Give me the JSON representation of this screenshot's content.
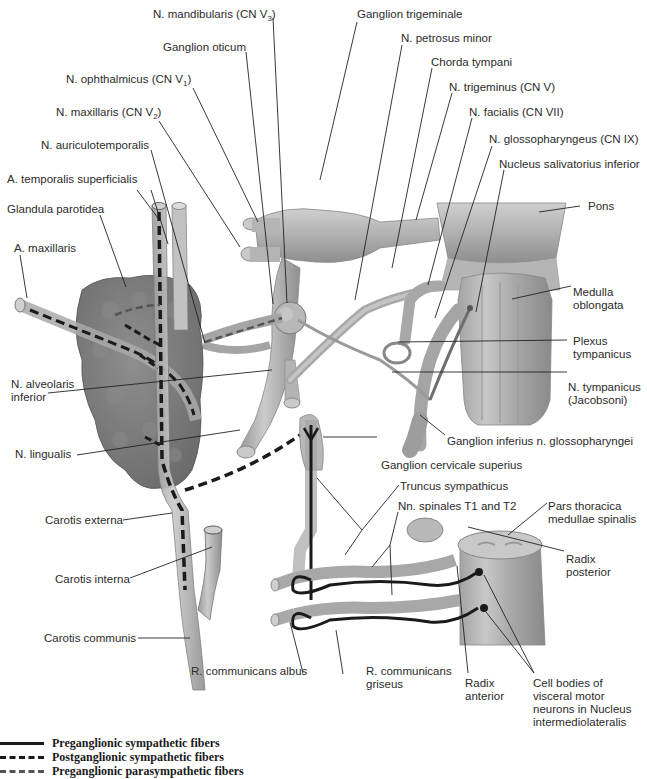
{
  "figure": {
    "colors": {
      "structure_fill": "#a9a9a9",
      "structure_highlight": "#d4d4d4",
      "gland_fill": "#7d7d7d",
      "fiber_color": "#1a1a1a",
      "leader_line": "#222222"
    }
  },
  "labels": {
    "n_mandibularis": "N. mandibularis (CN V",
    "n_mandibularis_sub": "3",
    "ganglion_oticum": "Ganglion oticum",
    "n_ophthalmicus": "N. ophthalmicus (CN V",
    "n_ophthalmicus_sub": "1",
    "n_maxillaris": "N. maxillaris (CN V",
    "n_maxillaris_sub": "2",
    "n_auriculotemporalis": "N. auriculotemporalis",
    "a_temporalis": "A. temporalis superficialis",
    "glandula_parotidea": "Glandula parotidea",
    "a_maxillaris": "A. maxillaris",
    "n_alveolaris_1": "N. alveolaris",
    "n_alveolaris_2": "inferior",
    "n_lingualis": "N. lingualis",
    "carotis_externa": "Carotis externa",
    "carotis_interna": "Carotis interna",
    "carotis_communis": "Carotis communis",
    "ganglion_trigeminale": "Ganglion trigeminale",
    "n_petrosus_minor": "N. petrosus minor",
    "chorda_tympani": "Chorda tympani",
    "n_trigeminus": "N. trigeminus (CN V)",
    "n_facialis": "N. facialis (CN VII)",
    "n_glossopharyngeus": "N. glossopharyngeus (CN IX)",
    "nucleus_salivatorius": "Nucleus salivatorius inferior",
    "pons": "Pons",
    "medulla_1": "Medulla",
    "medulla_2": "oblongata",
    "plexus_1": "Plexus",
    "plexus_2": "tympanicus",
    "n_tympanicus_1": "N. tympanicus",
    "n_tympanicus_2": "(Jacobsoni)",
    "ganglion_inferius": "Ganglion inferius n. glossopharyngei",
    "ganglion_cervicale": "Ganglion cervicale superius",
    "truncus": "Truncus sympathicus",
    "nn_spinales": "Nn. spinales T1 and T2",
    "pars_thoracica_1": "Pars thoracica",
    "pars_thoracica_2": "medullae spinalis",
    "radix_posterior_1": "Radix",
    "radix_posterior_2": "posterior",
    "r_albus": "R. communicans albus",
    "r_griseus_1": "R. communicans",
    "r_griseus_2": "griseus",
    "radix_anterior_1": "Radix",
    "radix_anterior_2": "anterior",
    "cell_bodies_1": "Cell bodies of",
    "cell_bodies_2": "visceral motor",
    "cell_bodies_3": "neurons in Nucleus",
    "cell_bodies_4": "intermediolateralis"
  },
  "legend": {
    "items": [
      {
        "style": "solid",
        "label": "Preganglionic sympathetic fibers"
      },
      {
        "style": "dashed",
        "label": "Postganglionic sympathetic fibers"
      },
      {
        "style": "dashed-gray",
        "label": "Preganglionic parasympathetic fibers"
      }
    ]
  }
}
